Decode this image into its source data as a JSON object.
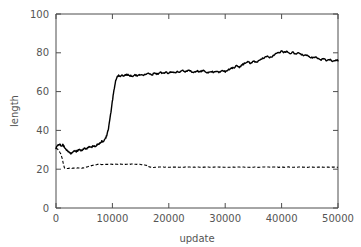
{
  "chart_data": {
    "type": "line",
    "title": "",
    "xlabel": "update",
    "ylabel": "length",
    "xlim": [
      0,
      50000
    ],
    "ylim": [
      0,
      100
    ],
    "grid": false,
    "legend": "none",
    "xticks": [
      0,
      10000,
      20000,
      30000,
      40000,
      50000
    ],
    "xtick_labels": [
      "0",
      "10000",
      "20000",
      "30000",
      "40000",
      "50000"
    ],
    "yticks": [
      0,
      20,
      40,
      60,
      80,
      100
    ],
    "ytick_labels": [
      "0",
      "20",
      "40",
      "60",
      "80",
      "100"
    ],
    "colors": {
      "line": "#000000",
      "axis": "#4d4d4d",
      "text": "#555555",
      "background": "#ffffff"
    },
    "series": [
      {
        "name": "upper-solid-line",
        "style": "solid",
        "x": [
          0,
          300,
          600,
          900,
          1200,
          1500,
          1800,
          2100,
          2400,
          2700,
          3000,
          3300,
          3600,
          3900,
          4200,
          4500,
          4800,
          5100,
          5400,
          5700,
          6000,
          6300,
          6600,
          6900,
          7200,
          7500,
          7800,
          8100,
          8400,
          8700,
          9000,
          9300,
          9600,
          9900,
          10200,
          10500,
          10800,
          11100,
          11400,
          11700,
          12000,
          12500,
          13000,
          13500,
          14000,
          14500,
          15000,
          15500,
          16000,
          16500,
          17000,
          17500,
          18000,
          18500,
          19000,
          19500,
          20000,
          20500,
          21000,
          21500,
          22000,
          22500,
          23000,
          23500,
          24000,
          24500,
          25000,
          25500,
          26000,
          26500,
          27000,
          27500,
          28000,
          28500,
          29000,
          29500,
          30000,
          30500,
          31000,
          31500,
          32000,
          32500,
          33000,
          33500,
          34000,
          34500,
          35000,
          35500,
          36000,
          36500,
          37000,
          37500,
          38000,
          38500,
          39000,
          39500,
          40000,
          40500,
          41000,
          41500,
          42000,
          42500,
          43000,
          43500,
          44000,
          44500,
          45000,
          45500,
          46000,
          46500,
          47000,
          47500,
          48000,
          48500,
          49000,
          49500,
          50000
        ],
        "y": [
          31.0,
          32.2,
          33.0,
          32.0,
          32.6,
          31.4,
          30.0,
          29.3,
          28.4,
          28.2,
          28.6,
          29.4,
          29.0,
          29.8,
          30.2,
          29.6,
          30.4,
          31.0,
          30.4,
          31.2,
          31.8,
          31.2,
          32.0,
          31.6,
          32.4,
          33.0,
          33.6,
          34.4,
          34.0,
          35.4,
          37.4,
          41.0,
          46.5,
          53.0,
          59.5,
          64.5,
          67.4,
          68.3,
          67.9,
          68.6,
          68.1,
          68.9,
          68.4,
          67.8,
          68.6,
          68.1,
          68.8,
          68.2,
          68.9,
          69.4,
          68.7,
          69.5,
          69.0,
          69.8,
          69.2,
          70.2,
          69.4,
          70.4,
          69.6,
          70.6,
          70.0,
          71.0,
          70.2,
          71.2,
          70.4,
          69.9,
          70.6,
          70.0,
          70.8,
          70.1,
          69.6,
          70.4,
          69.8,
          70.6,
          70.0,
          70.9,
          70.2,
          71.2,
          71.8,
          72.4,
          73.2,
          72.6,
          73.8,
          74.6,
          75.4,
          74.6,
          75.8,
          75.0,
          76.2,
          76.8,
          77.4,
          78.2,
          77.6,
          78.6,
          79.4,
          80.2,
          80.8,
          80.2,
          80.6,
          79.8,
          80.2,
          79.4,
          79.8,
          79.0,
          78.4,
          78.8,
          78.0,
          77.4,
          77.8,
          77.0,
          76.4,
          76.8,
          76.0,
          76.4,
          75.8,
          76.2,
          76.0
        ]
      },
      {
        "name": "lower-dashed-line",
        "style": "dashed",
        "x": [
          0,
          400,
          800,
          1100,
          1300,
          1500,
          1800,
          2200,
          2600,
          3000,
          3500,
          4000,
          4500,
          5000,
          5500,
          6000,
          6500,
          7000,
          7500,
          8000,
          8500,
          9000,
          9500,
          10000,
          10500,
          11000,
          11500,
          12000,
          12500,
          13000,
          13500,
          14000,
          14500,
          15000,
          15500,
          16000,
          16200,
          16500,
          16800,
          17000,
          17500,
          18000,
          19000,
          20000,
          21000,
          22000,
          23000,
          24000,
          25000,
          26000,
          27000,
          28000,
          29000,
          30000,
          31000,
          32000,
          33000,
          34000,
          35000,
          36000,
          37000,
          38000,
          39000,
          40000,
          41000,
          42000,
          43000,
          44000,
          45000,
          46000,
          47000,
          48000,
          49000,
          50000
        ],
        "y": [
          31.0,
          30.0,
          28.2,
          25.5,
          22.8,
          20.6,
          20.3,
          20.5,
          20.3,
          20.6,
          20.4,
          20.7,
          20.5,
          20.8,
          21.2,
          21.6,
          22.0,
          22.3,
          22.5,
          22.4,
          22.6,
          22.5,
          22.6,
          22.5,
          22.6,
          22.5,
          22.6,
          22.5,
          22.6,
          22.5,
          22.6,
          22.5,
          22.6,
          22.4,
          22.3,
          22.0,
          21.6,
          21.2,
          21.0,
          20.9,
          21.0,
          21.0,
          21.1,
          21.0,
          21.1,
          21.0,
          21.1,
          21.0,
          21.1,
          21.0,
          21.1,
          21.0,
          21.1,
          21.0,
          21.1,
          21.0,
          21.1,
          21.0,
          21.1,
          21.0,
          21.1,
          21.0,
          21.1,
          21.0,
          21.1,
          21.0,
          21.1,
          21.0,
          21.1,
          21.0,
          21.1,
          21.0,
          21.1,
          21.0
        ]
      }
    ]
  }
}
